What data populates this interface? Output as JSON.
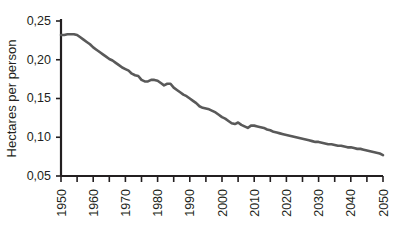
{
  "chart_data": {
    "type": "line",
    "title": "",
    "xlabel": "",
    "ylabel": "Hectares per person",
    "xlim": [
      1950,
      2050
    ],
    "ylim": [
      0.05,
      0.25
    ],
    "grid": false,
    "legend": "none",
    "y_ticks": [
      0.05,
      0.1,
      0.15,
      0.2,
      0.25
    ],
    "y_tick_labels": [
      "0,05",
      "0,10",
      "0,15",
      "0,20",
      "0,25"
    ],
    "y_minor_tick_step": 0,
    "x_ticks": [
      1950,
      1955,
      1960,
      1965,
      1970,
      1975,
      1980,
      1985,
      1990,
      1995,
      2000,
      2005,
      2010,
      2015,
      2020,
      2025,
      2030,
      2035,
      2040,
      2045,
      2050
    ],
    "x_tick_labels": [
      "1950",
      "",
      "1960",
      "",
      "1970",
      "",
      "1980",
      "",
      "1990",
      "",
      "2000",
      "",
      "2010",
      "",
      "2020",
      "",
      "2030",
      "",
      "2040",
      "",
      "2050"
    ],
    "x_labeled_ticks": [
      1950,
      1960,
      1970,
      1980,
      1990,
      2000,
      2010,
      2020,
      2030,
      2040,
      2050
    ],
    "x_label_rotation_deg": -90,
    "decimal_separator": ",",
    "line_color": "#595959",
    "axis_color": "#231f20",
    "background_color": "#ffffff",
    "series": [
      {
        "name": "Hectares per person",
        "x": [
          1950,
          1951,
          1952,
          1953,
          1954,
          1955,
          1956,
          1957,
          1958,
          1959,
          1960,
          1961,
          1962,
          1963,
          1964,
          1965,
          1966,
          1967,
          1968,
          1969,
          1970,
          1971,
          1972,
          1973,
          1974,
          1975,
          1976,
          1977,
          1978,
          1979,
          1980,
          1981,
          1982,
          1983,
          1984,
          1985,
          1986,
          1987,
          1988,
          1989,
          1990,
          1991,
          1992,
          1993,
          1994,
          1995,
          1996,
          1997,
          1998,
          1999,
          2000,
          2001,
          2002,
          2003,
          2004,
          2005,
          2006,
          2007,
          2008,
          2009,
          2010,
          2011,
          2012,
          2013,
          2014,
          2015,
          2016,
          2017,
          2018,
          2019,
          2020,
          2021,
          2022,
          2023,
          2024,
          2025,
          2026,
          2027,
          2028,
          2029,
          2030,
          2031,
          2032,
          2033,
          2034,
          2035,
          2036,
          2037,
          2038,
          2039,
          2040,
          2041,
          2042,
          2043,
          2044,
          2045,
          2046,
          2047,
          2048,
          2049,
          2050
        ],
        "y": [
          0.232,
          0.232,
          0.233,
          0.233,
          0.233,
          0.232,
          0.229,
          0.226,
          0.223,
          0.22,
          0.216,
          0.213,
          0.21,
          0.207,
          0.204,
          0.201,
          0.199,
          0.196,
          0.193,
          0.19,
          0.188,
          0.186,
          0.182,
          0.18,
          0.179,
          0.174,
          0.172,
          0.172,
          0.174,
          0.174,
          0.173,
          0.17,
          0.167,
          0.169,
          0.169,
          0.164,
          0.161,
          0.158,
          0.155,
          0.153,
          0.15,
          0.147,
          0.144,
          0.14,
          0.138,
          0.137,
          0.136,
          0.134,
          0.132,
          0.129,
          0.126,
          0.124,
          0.121,
          0.118,
          0.117,
          0.119,
          0.116,
          0.114,
          0.112,
          0.115,
          0.115,
          0.114,
          0.113,
          0.112,
          0.11,
          0.109,
          0.107,
          0.106,
          0.105,
          0.104,
          0.103,
          0.102,
          0.101,
          0.1,
          0.099,
          0.098,
          0.097,
          0.096,
          0.095,
          0.094,
          0.094,
          0.093,
          0.092,
          0.091,
          0.091,
          0.09,
          0.089,
          0.089,
          0.088,
          0.087,
          0.087,
          0.086,
          0.085,
          0.085,
          0.084,
          0.083,
          0.082,
          0.081,
          0.08,
          0.079,
          0.077
        ]
      }
    ],
    "annotations": []
  },
  "geometry": {
    "plot_left_px": 61,
    "plot_right_px": 383,
    "plot_top_px": 21,
    "plot_bottom_px": 176
  }
}
